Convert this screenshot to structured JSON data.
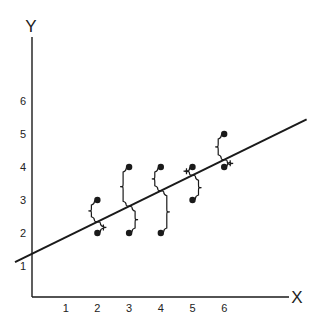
{
  "chart_data": {
    "type": "scatter",
    "title": "",
    "xlabel": "X",
    "ylabel": "Y",
    "x_ticks": [
      "1",
      "2",
      "3",
      "4",
      "5",
      "6"
    ],
    "y_ticks": [
      "1",
      "2",
      "3",
      "4",
      "5",
      "6"
    ],
    "xlim": [
      0,
      8
    ],
    "ylim": [
      0,
      7.5
    ],
    "grid": false,
    "legend": null,
    "points": [
      {
        "x": 2,
        "y": 3
      },
      {
        "x": 2,
        "y": 2
      },
      {
        "x": 3,
        "y": 4
      },
      {
        "x": 3,
        "y": 2
      },
      {
        "x": 4,
        "y": 4
      },
      {
        "x": 4,
        "y": 2
      },
      {
        "x": 5,
        "y": 4
      },
      {
        "x": 5,
        "y": 3
      },
      {
        "x": 6,
        "y": 5
      },
      {
        "x": 6,
        "y": 4
      }
    ],
    "regression_line": {
      "intercept": 1.4,
      "slope": 0.47,
      "x_range": [
        -0.6,
        8.6
      ]
    },
    "annotations": "Curly braces mark vertical residuals from each point to the fitted line"
  },
  "axes": {
    "x_label": "X",
    "y_label": "Y"
  },
  "colors": {
    "ink": "#1a1a1a",
    "background": "#ffffff"
  }
}
